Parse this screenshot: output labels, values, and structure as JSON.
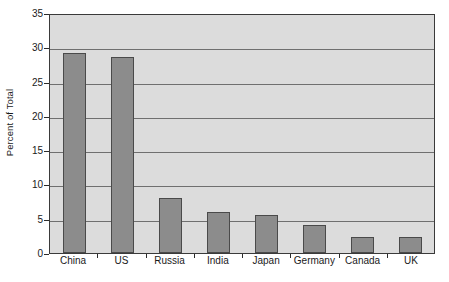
{
  "chart_data": {
    "type": "bar",
    "title": "",
    "xlabel": "",
    "ylabel": "Percent of Total",
    "categories": [
      "China",
      "US",
      "Russia",
      "India",
      "Japan",
      "Germany",
      "Canada",
      "UK"
    ],
    "values": [
      29.2,
      28.6,
      8.0,
      6.0,
      5.5,
      4.1,
      2.4,
      2.4
    ],
    "ylim": [
      0,
      35
    ],
    "ytick_labels": [
      "0",
      "5",
      "10",
      "15",
      "20",
      "25",
      "30",
      "35"
    ],
    "ytick_values": [
      0,
      5,
      10,
      15,
      20,
      25,
      30,
      35
    ],
    "grid": true,
    "legend": "none",
    "colors": {
      "bar_fill": "#8c8c8c",
      "bar_border": "#4a4a4a",
      "plot_background": "#dcdcdc",
      "gridline": "#6f6f6f",
      "axis": "#3a3a3a",
      "text": "#1a1a1a",
      "page_background": "#ffffff"
    }
  }
}
